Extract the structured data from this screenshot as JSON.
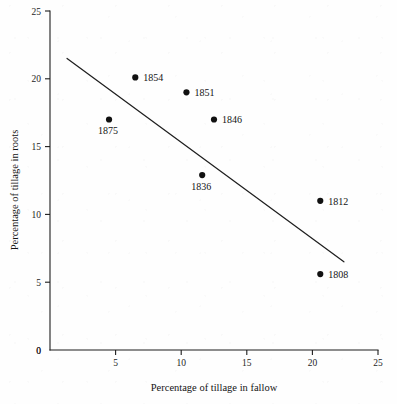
{
  "chart_data": {
    "type": "scatter",
    "title": "",
    "xlabel": "Percentage of tillage in fallow",
    "ylabel": "Percentage of tillage in roots",
    "xlim": [
      0,
      25
    ],
    "ylim": [
      0,
      25
    ],
    "xticks": [
      "0",
      "5",
      "10",
      "15",
      "20",
      "25"
    ],
    "xtick_values": [
      0,
      5,
      10,
      15,
      20,
      25
    ],
    "yticks": [
      "0",
      "5",
      "10",
      "15",
      "20",
      "25"
    ],
    "ytick_values": [
      0,
      5,
      10,
      15,
      20,
      25
    ],
    "grid": false,
    "legend": "none",
    "points": [
      {
        "label": "1875",
        "x": 4.5,
        "y": 17.0,
        "label_pos": "below"
      },
      {
        "label": "1854",
        "x": 6.5,
        "y": 20.1,
        "label_pos": "right"
      },
      {
        "label": "1851",
        "x": 10.4,
        "y": 19.0,
        "label_pos": "right"
      },
      {
        "label": "1846",
        "x": 12.5,
        "y": 17.0,
        "label_pos": "right"
      },
      {
        "label": "1836",
        "x": 11.6,
        "y": 12.9,
        "label_pos": "below"
      },
      {
        "label": "1812",
        "x": 20.6,
        "y": 11.0,
        "label_pos": "right"
      },
      {
        "label": "1808",
        "x": 20.6,
        "y": 5.6,
        "label_pos": "right"
      }
    ],
    "trend_line": {
      "x0": 1.3,
      "y0": 21.5,
      "x1": 22.4,
      "y1": 6.5
    },
    "colors": {
      "point": "#111111",
      "line": "#1f1f1f",
      "axis": "#1d1d1d",
      "background": "#fefefe"
    }
  }
}
